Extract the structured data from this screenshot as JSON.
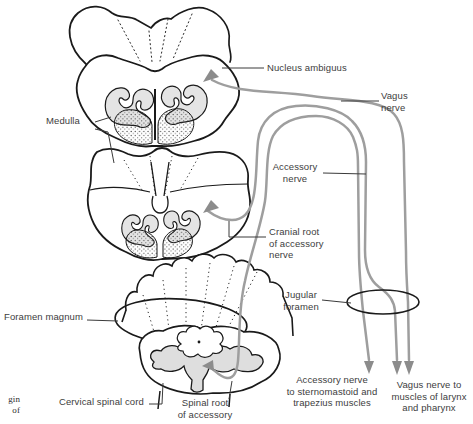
{
  "labels": {
    "nucleus_ambiguus": "Nucleus ambiguus",
    "vagus_nerve": "Vagus\nnerve",
    "medulla": "Medulla",
    "accessory_nerve": "Accessory\nnerve",
    "cranial_root": "Cranial root\nof accessory\nnerve",
    "foramen_magnum": "Foramen magnum",
    "jugular_foramen": "Jugular\nforamen",
    "cervical_spinal_cord": "Cervical spinal cord",
    "spinal_root": "Spinal root\nof accessory",
    "accessory_destination": "Accessory nerve\nto sternomastoid and\ntrapezius muscles",
    "vagus_destination": "Vagus nerve to\nmuscles of larynx\nand pharynx",
    "caption_fragment": "gin\nof"
  },
  "colors": {
    "nerve_line": "#9e9e9e",
    "nerve_arrowhead": "#8c8c8c",
    "anatomy_outline": "#1a1a1a",
    "leader_line": "#3a3a3a",
    "olive_fill": "#e4e4e4",
    "gray_matter_fill": "#dedede",
    "label_text": "#3d3d3d",
    "background": "#ffffff"
  }
}
